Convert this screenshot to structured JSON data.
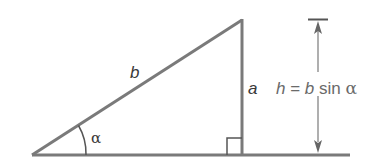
{
  "diagram": {
    "type": "right-triangle-height",
    "labels": {
      "hypotenuse": "b",
      "vertical_side": "a",
      "angle": "α",
      "height_formula_lhs": "h",
      "height_formula_eq": " = ",
      "height_formula_b": "b",
      "height_formula_sin": " sin ",
      "height_formula_alpha": "α"
    },
    "colors": {
      "stroke": "#7a7a7a",
      "dark_stroke": "#555555",
      "text": "#6a6a6a",
      "text_dark": "#3a3a3a",
      "background": "#ffffff"
    }
  }
}
